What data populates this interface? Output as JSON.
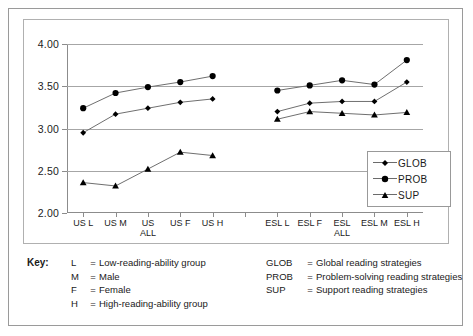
{
  "chart_data": {
    "type": "line",
    "title": "",
    "xlabel": "",
    "ylabel": "",
    "ylim": [
      2.0,
      4.0
    ],
    "ytick_values": [
      2.0,
      2.5,
      3.0,
      3.5,
      4.0
    ],
    "ytick_labels": [
      "2.00",
      "2.50",
      "3.00",
      "3.50",
      "4.00"
    ],
    "grid": true,
    "legend_position": "inside-right",
    "categories": [
      "US L",
      "US M",
      "US ALL",
      "US F",
      "US H",
      "",
      "ESL L",
      "ESL F",
      "ESL ALL",
      "ESL M",
      "ESL H"
    ],
    "category_lines": [
      [
        "US",
        "L"
      ],
      [
        "US",
        "M"
      ],
      [
        "US",
        "ALL"
      ],
      [
        "US",
        "F"
      ],
      [
        "US",
        "H"
      ],
      [
        "",
        ""
      ],
      [
        "ESL",
        "L"
      ],
      [
        "ESL",
        "F"
      ],
      [
        "ESL",
        "ALL"
      ],
      [
        "ESL",
        "M"
      ],
      [
        "ESL",
        "H"
      ]
    ],
    "series": [
      {
        "name": "GLOB",
        "marker": "diamond",
        "color": "#000000",
        "values": [
          2.95,
          3.17,
          3.24,
          3.31,
          3.35,
          null,
          3.2,
          3.3,
          3.32,
          3.32,
          3.55
        ]
      },
      {
        "name": "PROB",
        "marker": "circle",
        "color": "#000000",
        "values": [
          3.24,
          3.42,
          3.49,
          3.55,
          3.62,
          null,
          3.45,
          3.51,
          3.57,
          3.52,
          3.81
        ]
      },
      {
        "name": "SUP",
        "marker": "triangle",
        "color": "#000000",
        "values": [
          2.36,
          2.32,
          2.52,
          2.72,
          2.68,
          null,
          3.11,
          3.2,
          3.18,
          3.16,
          3.19
        ]
      }
    ]
  },
  "legend": {
    "items": [
      {
        "label": "GLOB",
        "marker": "diamond"
      },
      {
        "label": "PROB",
        "marker": "circle"
      },
      {
        "label": "SUP",
        "marker": "triangle"
      }
    ]
  },
  "key": {
    "title": "Key:",
    "left_column": [
      {
        "abbr": "L",
        "eq": "=",
        "desc": "Low-reading-ability group"
      },
      {
        "abbr": "M",
        "eq": "=",
        "desc": "Male"
      },
      {
        "abbr": "F",
        "eq": "=",
        "desc": "Female"
      },
      {
        "abbr": "H",
        "eq": "=",
        "desc": "High-reading-ability group"
      }
    ],
    "right_column": [
      {
        "abbr": "GLOB",
        "eq": "=",
        "desc": "Global reading strategies"
      },
      {
        "abbr": "PROB",
        "eq": "=",
        "desc": "Problem-solving reading strategies"
      },
      {
        "abbr": "SUP",
        "eq": "=",
        "desc": "Support reading strategies"
      }
    ]
  }
}
